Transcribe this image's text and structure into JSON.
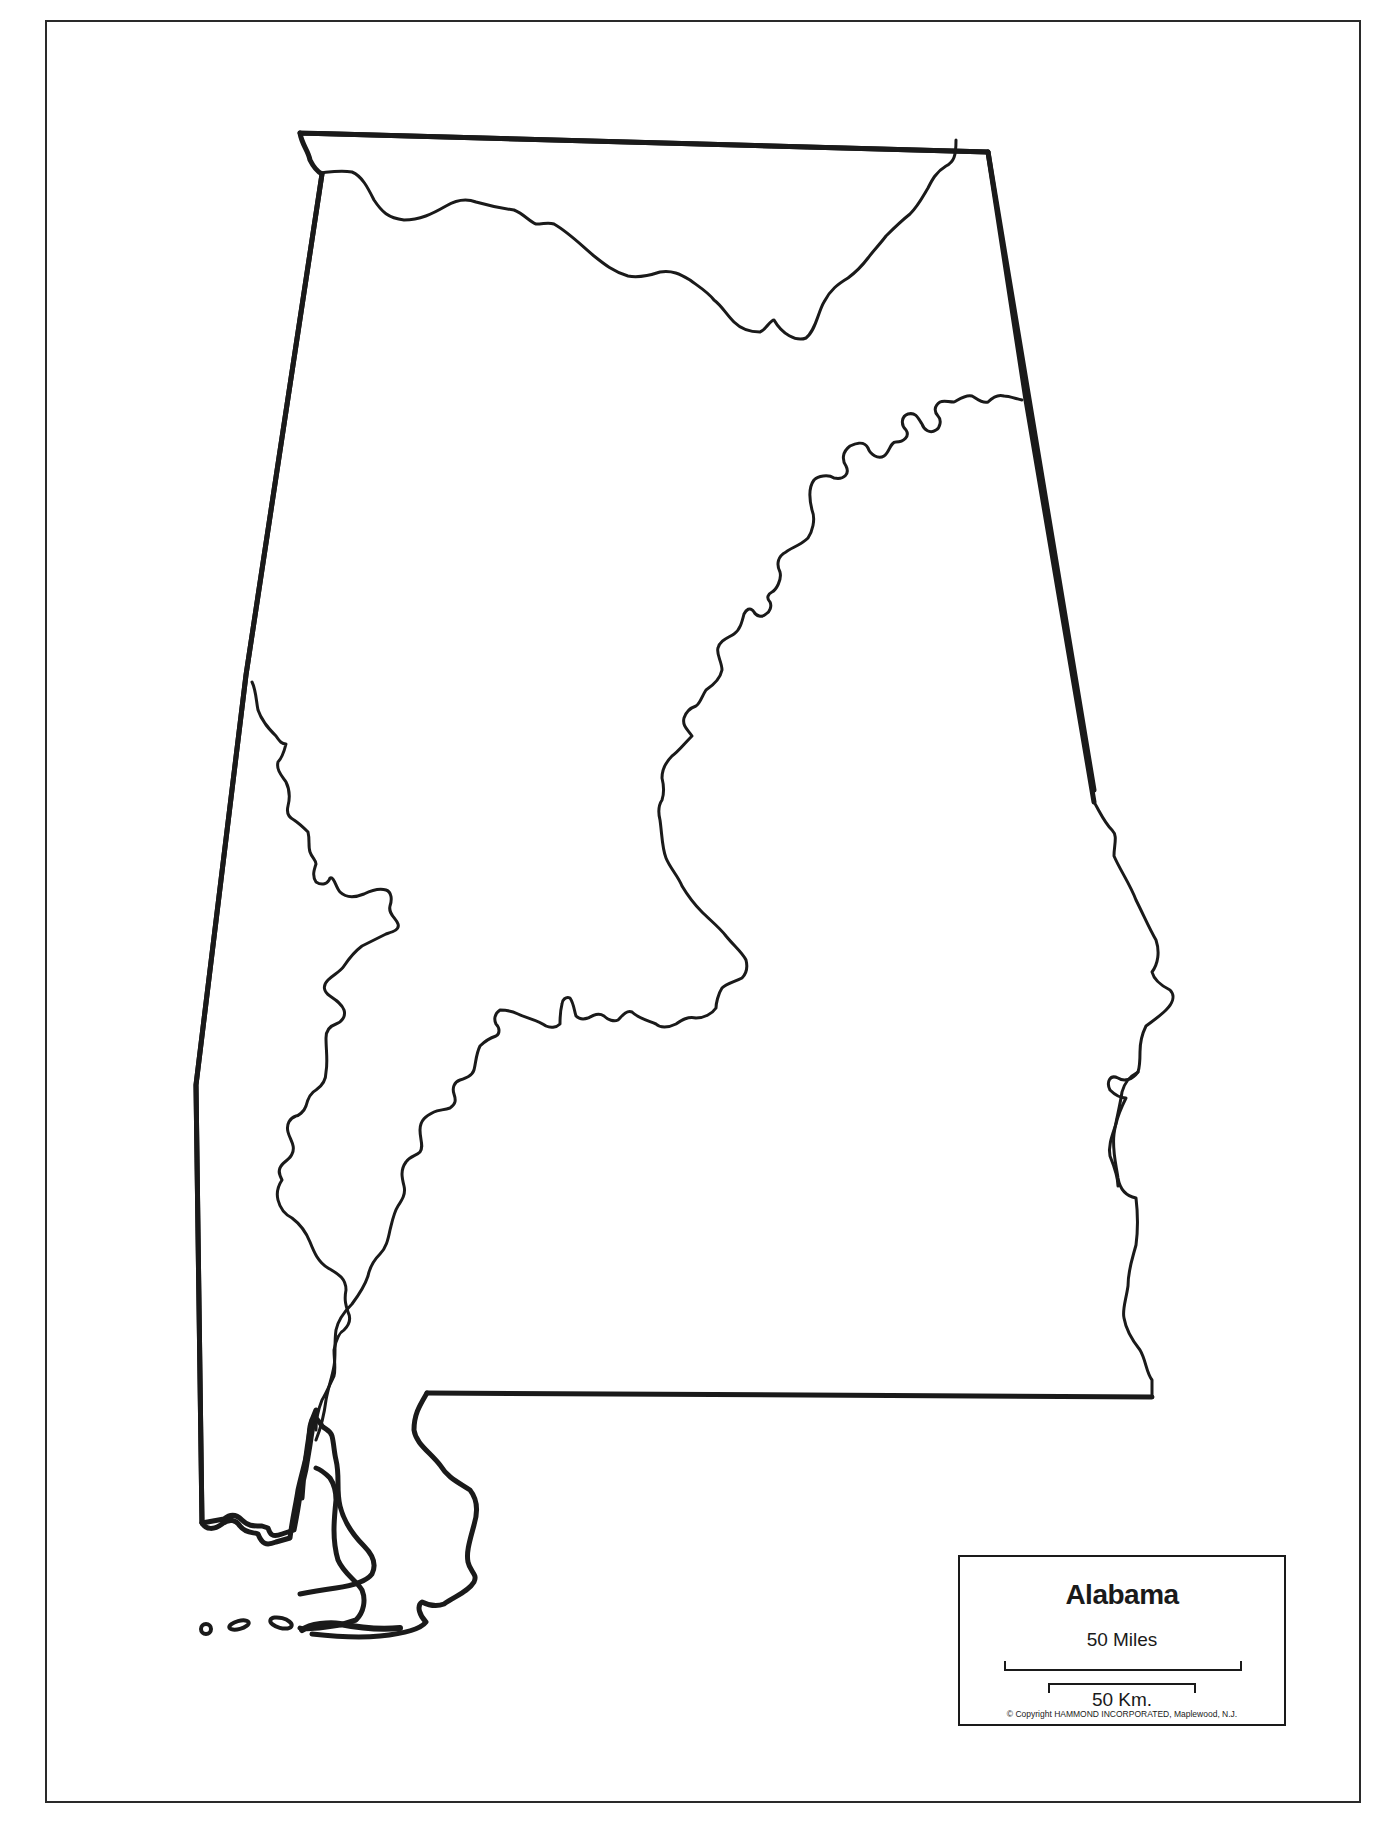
{
  "map": {
    "state_name": "Alabama",
    "style": "blank outline map",
    "features": [
      "state-border",
      "tennessee-river",
      "coosa-alabama-river",
      "tombigbee-river",
      "chattahoochee-river",
      "mobile-bay",
      "gulf-islands"
    ],
    "line_color": "#1a1a1a",
    "background_color": "#ffffff"
  },
  "legend": {
    "title": "Alabama",
    "scale_miles": "50 Miles",
    "scale_km": "50 Km.",
    "copyright": "© Copyright HAMMOND INCORPORATED, Maplewood, N.J."
  }
}
